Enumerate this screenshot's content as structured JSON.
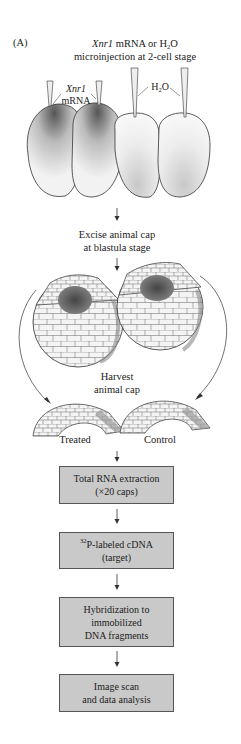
{
  "figure": {
    "panel_label": "(A)",
    "title": {
      "gene": "Xnr1",
      "line1_rest": " mRNA or H",
      "line1_sub": "2",
      "line1_end": "O",
      "line2": "microinjection at 2-cell stage"
    },
    "embryos_2cell": {
      "left_label_gene": "Xnr1",
      "left_label_mol": "mRNA",
      "right_label_pre": "H",
      "right_label_sub": "2",
      "right_label_post": "O"
    },
    "step_excise": {
      "line1": "Excise animal cap",
      "line2": "at blastula stage"
    },
    "step_harvest": {
      "line1": "Harvest",
      "line2": "animal cap"
    },
    "caps": {
      "left_label": "Treated",
      "right_label": "Control"
    },
    "boxes": [
      {
        "line1": "Total RNA extraction",
        "line2": "(×20 caps)"
      },
      {
        "sup": "32",
        "line1": "P-labeled cDNA",
        "line2": "(target)"
      },
      {
        "line1": "Hybridization to",
        "line2": "immobilized",
        "line3": "DNA fragments"
      },
      {
        "line1": "Image scan",
        "line2": "and data analysis"
      }
    ],
    "colors": {
      "box_fill": "#c9c9c9",
      "box_border": "#555555",
      "line": "#333333",
      "embryo_shade": "#555555"
    }
  }
}
